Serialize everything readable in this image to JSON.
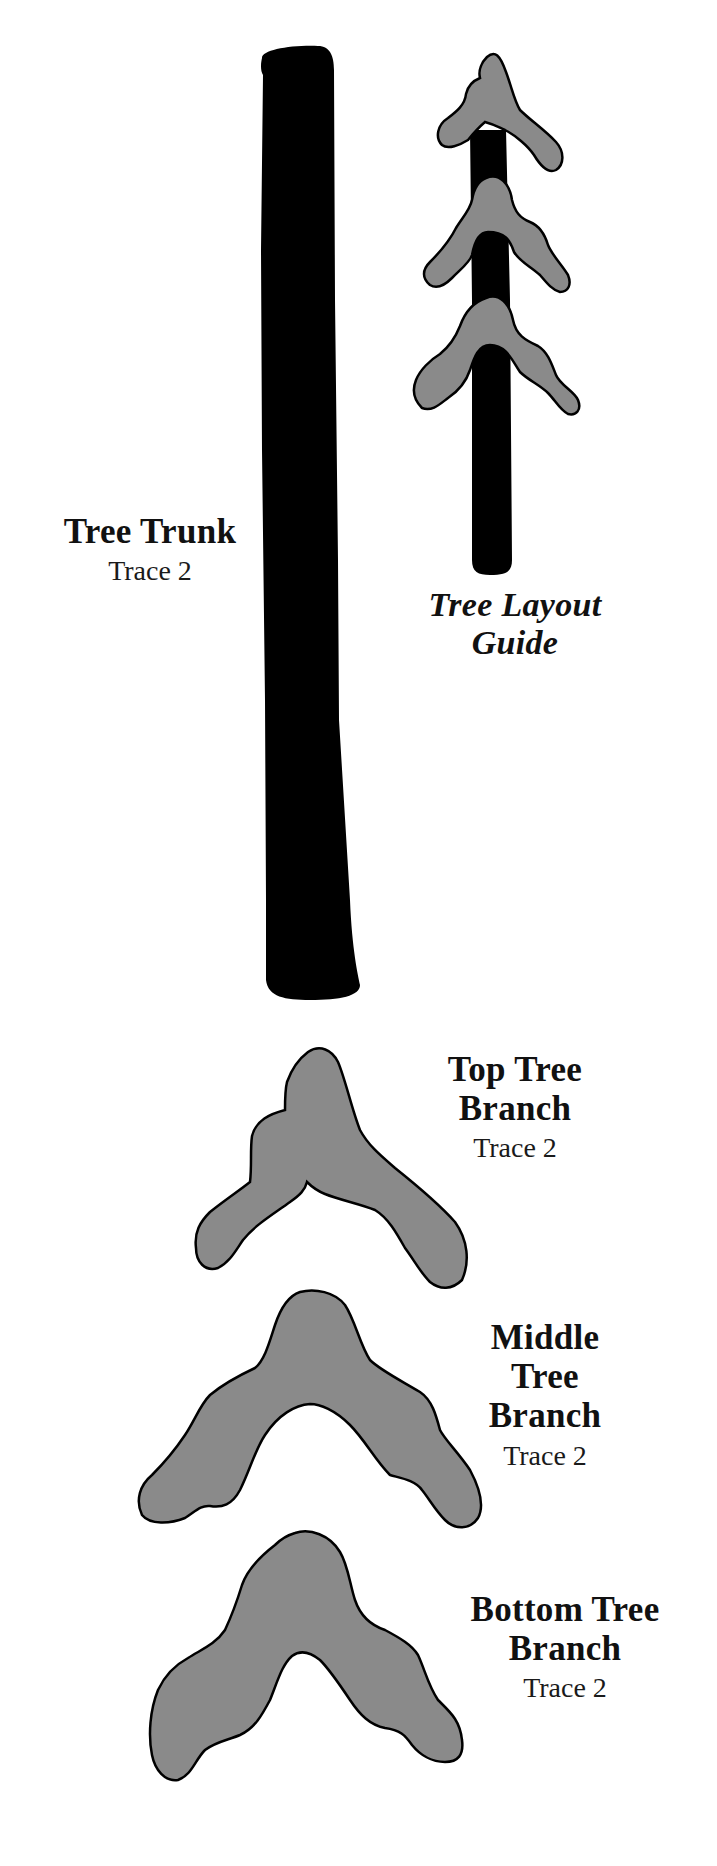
{
  "document": {
    "type": "craft tracing template",
    "background_color": "#ffffff",
    "trunk_color": "#000000",
    "branch_fill_color": "#8a8a8a",
    "branch_outline_color": "#000000"
  },
  "pieces": {
    "trunk": {
      "title": "Tree Trunk",
      "instruction": "Trace 2"
    },
    "layout_guide": {
      "title_line1": "Tree Layout",
      "title_line2": "Guide"
    },
    "top_branch": {
      "title_line1": "Top Tree",
      "title_line2": "Branch",
      "instruction": "Trace 2"
    },
    "middle_branch": {
      "title_line1": "Middle",
      "title_line2": "Tree",
      "title_line3": "Branch",
      "instruction": "Trace 2"
    },
    "bottom_branch": {
      "title_line1": "Bottom Tree",
      "title_line2": "Branch",
      "instruction": "Trace 2"
    }
  }
}
